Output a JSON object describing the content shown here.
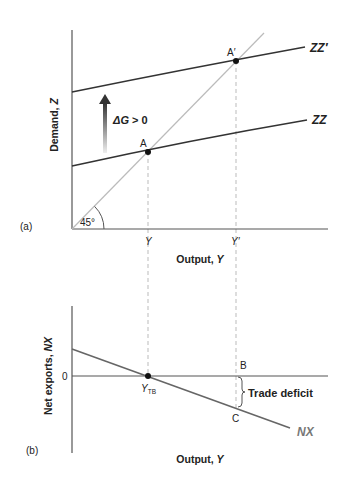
{
  "panel_a": {
    "panel_label": "(a)",
    "y_axis_label_main": "Demand, ",
    "y_axis_label_var": "Z",
    "x_axis_label_main": "Output, ",
    "x_axis_label_var": "Y",
    "angle_label": "45°",
    "shift_label_delta": "ΔG",
    "shift_label_rest": " > 0",
    "curves": {
      "zz": "ZZ",
      "zz_prime": "ZZ′"
    },
    "points": {
      "a": "A",
      "a_prime": "A′"
    },
    "x_ticks": {
      "y": "Y",
      "y_prime": "Y′"
    }
  },
  "panel_b": {
    "panel_label": "(b)",
    "y_axis_label_main": "Net exports, ",
    "y_axis_label_var": "NX",
    "x_axis_label_main": "Output, ",
    "x_axis_label_var": "Y",
    "zero_label": "0",
    "curve_label": "NX",
    "ytb_main": "Y",
    "ytb_sub": "TB",
    "points": {
      "b": "B",
      "c": "C"
    },
    "annotation": "Trade deficit"
  },
  "colors": {
    "axis": "#555555",
    "zz_line": "#333333",
    "diag_line": "#bbbbbb",
    "nx_line": "#666666",
    "nx_label": "#777777",
    "dashed": "#bbbbbb"
  }
}
